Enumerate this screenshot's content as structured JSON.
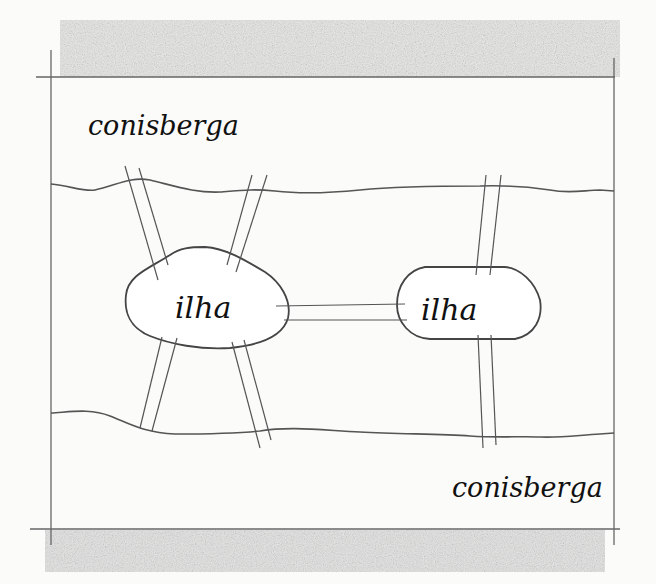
{
  "diagram": {
    "labels": {
      "north_bank": "conisberga",
      "south_bank": "conisberga",
      "island_west": "ilha",
      "island_east": "ilha"
    },
    "colors": {
      "paper": "#fbfbfa",
      "pencil": "#555555",
      "shading": "#b8b8b8",
      "ink": "#111111"
    },
    "bridges_count": 7,
    "landmasses_count": 4
  }
}
